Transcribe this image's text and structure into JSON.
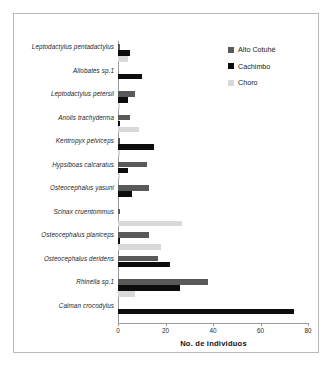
{
  "chart_data": {
    "type": "bar",
    "orientation": "horizontal",
    "title": "",
    "xlabel": "No. de individuos",
    "ylabel": "",
    "xlim": [
      0,
      80
    ],
    "xticks": [
      0,
      20,
      40,
      60,
      80
    ],
    "grid": false,
    "legend_position": "top-right",
    "categories": [
      "Leptodactylus pentadactylus",
      "Allobates sp.1",
      "Leptodactylus petersii",
      "Anolis trachyderma",
      "Kentropyx pelviceps",
      "Hypsiboas calcaratus",
      "Osteocephalus yasuni",
      "Scinax cruentommus",
      "Osteocephalus planiceps",
      "Osteocephalus deridens",
      "Rhinella sp.1",
      "Caiman crocodylus"
    ],
    "series": [
      {
        "name": "Alto Cotuhé",
        "color": "#595959",
        "values": [
          1,
          0,
          7,
          5,
          1,
          12,
          13,
          1,
          13,
          17,
          38,
          0
        ]
      },
      {
        "name": "Cachimbo",
        "color": "#0d0d0d",
        "values": [
          5,
          10,
          4,
          1,
          15,
          4,
          6,
          0,
          1,
          22,
          26,
          74
        ]
      },
      {
        "name": "Choro",
        "color": "#d9d9d9",
        "values": [
          4,
          0,
          1,
          9,
          1,
          1,
          0,
          27,
          18,
          0,
          7,
          0
        ]
      }
    ]
  },
  "legend": {
    "items": [
      {
        "label": "Alto Cotuhé",
        "color": "#595959"
      },
      {
        "label": "Cachimbo",
        "color": "#0d0d0d"
      },
      {
        "label": "Choro",
        "color": "#d9d9d9"
      }
    ]
  },
  "axis": {
    "x_title": "No. de individuos",
    "tick_labels": [
      "0",
      "20",
      "40",
      "60",
      "80"
    ]
  }
}
